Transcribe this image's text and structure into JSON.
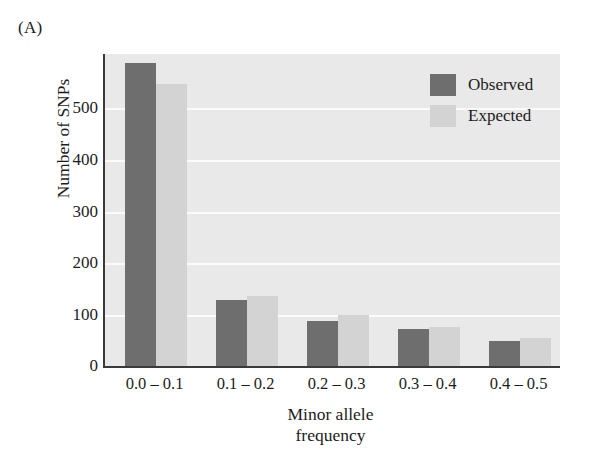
{
  "panel": {
    "letter": "(A)"
  },
  "chart_data": {
    "type": "bar",
    "title": "",
    "panel_label": "(A)",
    "categories": [
      "0.0 – 0.1",
      "0.1 – 0.2",
      "0.2 – 0.3",
      "0.3 – 0.4",
      "0.4 – 0.5"
    ],
    "series": [
      {
        "name": "Observed",
        "color": "#6e6e6e",
        "values": [
          582,
          128,
          89,
          72,
          50
        ]
      },
      {
        "name": "Expected",
        "color": "#d3d3d3",
        "values": [
          543,
          137,
          100,
          77,
          56
        ]
      }
    ],
    "xlabel": "Minor allele frequency",
    "xlabel_line1": "Minor allele",
    "xlabel_line2": "frequency",
    "ylabel": "Number of SNPs",
    "ylim": [
      0,
      600
    ],
    "yticks": [
      0,
      100,
      200,
      300,
      400,
      500
    ],
    "ytick_labels": [
      "0",
      "100",
      "200",
      "300",
      "400",
      "500"
    ],
    "grid": true,
    "grid_axis": "y",
    "legend_position": "top-right",
    "plot_background": "#e9e9e9",
    "gridline_color": "#fbfbfb",
    "axis_color": "#3a3a3a"
  },
  "legend": {
    "items": [
      {
        "label": "Observed",
        "swatch": "observed"
      },
      {
        "label": "Expected",
        "swatch": "expected"
      }
    ]
  },
  "axes": {
    "y_tick_labels": [
      "500",
      "400",
      "300",
      "200",
      "100",
      "0"
    ],
    "x_tick_labels": [
      "0.0 – 0.1",
      "0.1 – 0.2",
      "0.2 – 0.3",
      "0.3 – 0.4",
      "0.4 – 0.5"
    ]
  }
}
